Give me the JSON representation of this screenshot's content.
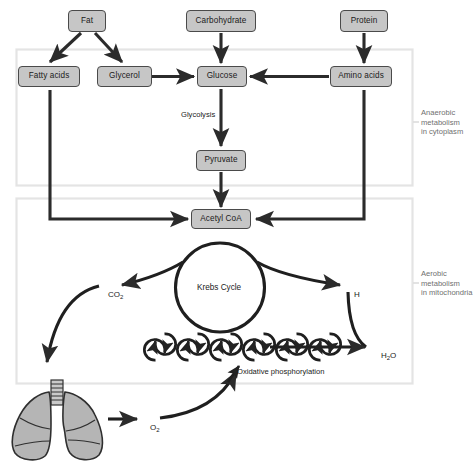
{
  "diagram": {
    "colors": {
      "node_fill": "#c6c6c6",
      "node_stroke": "#4a4a4a",
      "arrow": "#2b2b2b",
      "panel_stroke": "#e2e2e2",
      "side_label": "#6f6f6f",
      "lung_fill": "#b5b5b5",
      "background": "#ffffff"
    },
    "panels": [
      {
        "id": "anaerobic",
        "label": "Anaerobic\nmetabolism\nin cytoplasm"
      },
      {
        "id": "aerobic",
        "label": "Aerobic\nmetabolism\nin mitochondria"
      }
    ],
    "nodes": [
      {
        "id": "fat",
        "label": "Fat"
      },
      {
        "id": "carbohydrate",
        "label": "Carbohydrate"
      },
      {
        "id": "protein",
        "label": "Protein"
      },
      {
        "id": "fatty-acids",
        "label": "Fatty acids"
      },
      {
        "id": "glycerol",
        "label": "Glycerol"
      },
      {
        "id": "glucose",
        "label": "Glucose"
      },
      {
        "id": "amino-acids",
        "label": "Amino acids"
      },
      {
        "id": "pyruvate",
        "label": "Pyruvate"
      },
      {
        "id": "acetyl-coa",
        "label": "Acetyl CoA"
      }
    ],
    "labels": {
      "glycolysis": "Glycolysis",
      "krebs_cycle": "Krebs Cycle",
      "oxidative_phosphorylation": "Oxidative phosphorylation",
      "co2": "CO",
      "co2_sub": "2",
      "h": "H",
      "h2o": "H",
      "h2o_sub": "2",
      "h2o_tail": "O",
      "o2": "O",
      "o2_sub": "2"
    },
    "organ": {
      "id": "lungs",
      "name": "lungs"
    },
    "flows": [
      {
        "from": "fat",
        "to": "fatty-acids"
      },
      {
        "from": "fat",
        "to": "glycerol"
      },
      {
        "from": "carbohydrate",
        "to": "glucose"
      },
      {
        "from": "protein",
        "to": "amino-acids"
      },
      {
        "from": "glycerol",
        "to": "glucose"
      },
      {
        "from": "amino-acids",
        "to": "glucose"
      },
      {
        "from": "glucose",
        "to": "pyruvate",
        "label": "Glycolysis"
      },
      {
        "from": "pyruvate",
        "to": "acetyl-coa"
      },
      {
        "from": "fatty-acids",
        "to": "acetyl-coa"
      },
      {
        "from": "amino-acids",
        "to": "acetyl-coa"
      },
      {
        "from": "acetyl-coa",
        "to": "krebs-cycle"
      },
      {
        "from": "krebs-cycle",
        "to": "co2"
      },
      {
        "from": "krebs-cycle",
        "to": "h"
      },
      {
        "from": "h",
        "to": "h2o"
      },
      {
        "from": "oxidative-phosphorylation",
        "to": "h2o"
      },
      {
        "from": "co2",
        "to": "lungs"
      },
      {
        "from": "lungs",
        "to": "o2"
      },
      {
        "from": "o2",
        "to": "oxidative-phosphorylation"
      }
    ]
  }
}
